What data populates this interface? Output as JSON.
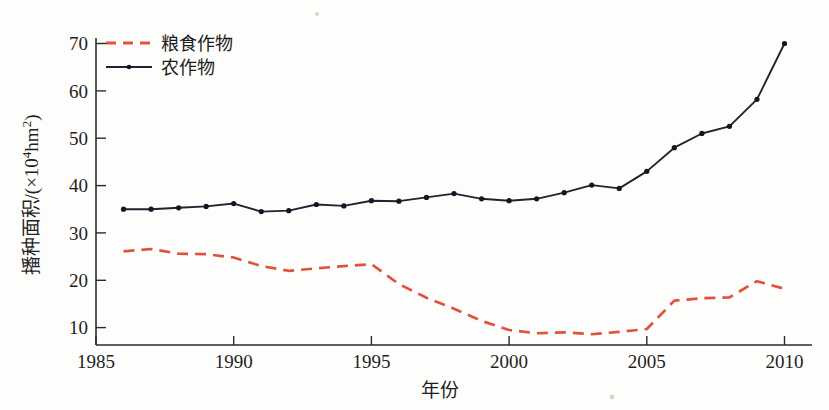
{
  "chart_data": {
    "type": "line",
    "title": "",
    "xlabel": "年份",
    "ylabel": "播种面积/(×10⁴hm²)",
    "xlim": [
      1985,
      2011
    ],
    "ylim": [
      5,
      72
    ],
    "xticks": [
      1985,
      1990,
      1995,
      2000,
      2005,
      2010
    ],
    "xtick_labels": [
      "1985",
      "1990",
      "1995",
      "2000",
      "2005",
      "2010"
    ],
    "yticks": [
      10,
      20,
      30,
      40,
      50,
      60,
      70
    ],
    "ytick_labels": [
      "10",
      "20",
      "30",
      "40",
      "50",
      "60",
      "70"
    ],
    "grid": false,
    "legend_position": "top-left",
    "x": [
      1986,
      1987,
      1988,
      1989,
      1990,
      1991,
      1992,
      1993,
      1994,
      1995,
      1996,
      1997,
      1998,
      1999,
      2000,
      2001,
      2002,
      2003,
      2004,
      2005,
      2006,
      2007,
      2008,
      2009,
      2010
    ],
    "series": [
      {
        "name": "粮食作物",
        "color": "#e2513c",
        "style": "dashed",
        "markers": false,
        "values": [
          26.1,
          26.6,
          25.6,
          25.5,
          24.8,
          23.0,
          22.0,
          22.5,
          23.0,
          23.4,
          19.2,
          16.3,
          14.0,
          11.4,
          9.5,
          8.8,
          9.0,
          8.6,
          9.1,
          9.7,
          15.7,
          16.2,
          16.4,
          19.8,
          18.2
        ]
      },
      {
        "name": "农作物",
        "color": "#222230",
        "style": "solid",
        "markers": true,
        "values": [
          35.0,
          35.0,
          35.3,
          35.6,
          36.2,
          34.5,
          34.7,
          36.0,
          35.7,
          36.8,
          36.7,
          37.5,
          38.3,
          37.2,
          36.8,
          37.2,
          38.5,
          40.1,
          39.4,
          43.0,
          48.0,
          51.0,
          52.5,
          58.2,
          70.0
        ]
      }
    ]
  },
  "axes": {
    "y_label_text": "播种面积/(×10",
    "y_label_exp": "4",
    "y_label_tail": "hm",
    "y_label_tail_exp": "2",
    "y_label_close": ")",
    "x_label": "年份"
  },
  "legend": {
    "items": [
      {
        "label": "粮食作物",
        "swatch": "dashed-red-line"
      },
      {
        "label": "农作物",
        "swatch": "solid-black-line-marker"
      }
    ]
  }
}
